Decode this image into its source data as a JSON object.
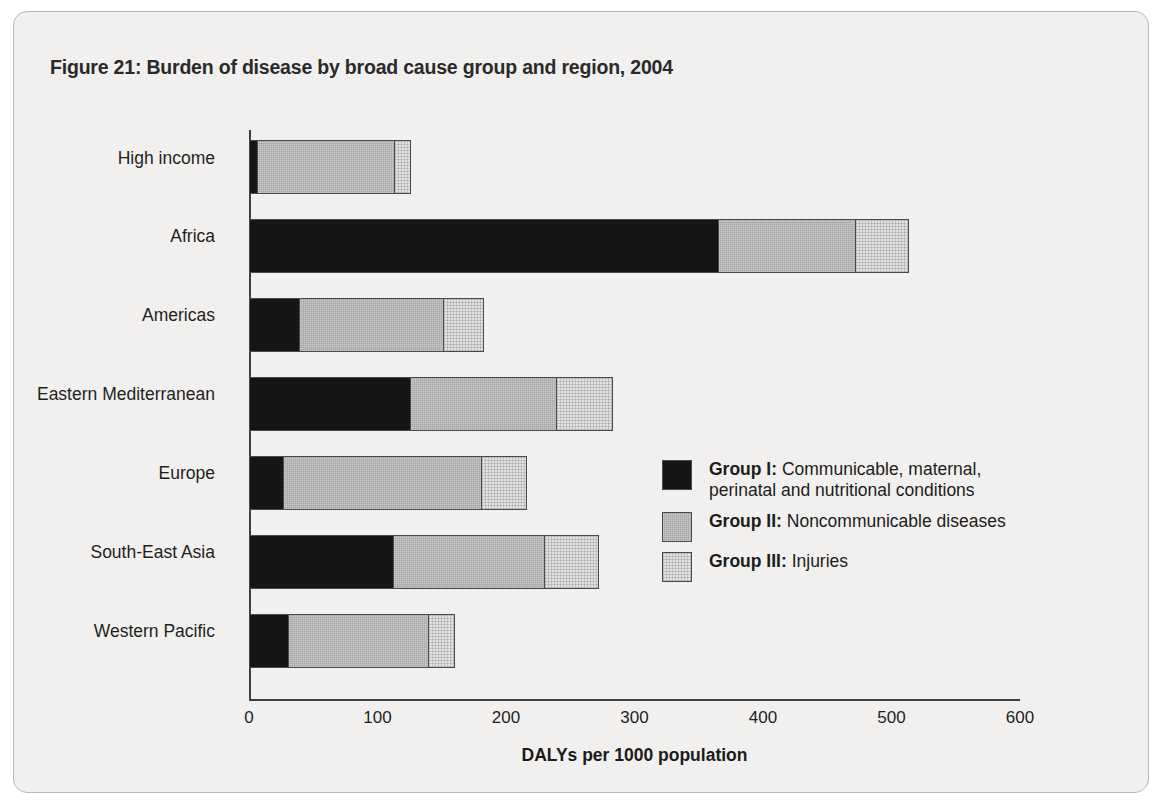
{
  "figure": {
    "title": "Figure 21: Burden of disease by broad cause group and region, 2004"
  },
  "colors": {
    "group_i": "#151515",
    "group_ii": "#a5a5a5",
    "group_iii": "#e2e2e0",
    "frame_background": "#f1f0ee",
    "frame_border": "#b9b8b6",
    "axis": "#3f3f3f"
  },
  "legend": {
    "position": "inside-right",
    "items": [
      {
        "key": "group_i",
        "bold_label": "Group I:",
        "description": " Communicable, maternal, perinatal and nutritional conditions"
      },
      {
        "key": "group_ii",
        "bold_label": "Group II:",
        "description": " Noncommunicable diseases"
      },
      {
        "key": "group_iii",
        "bold_label": "Group III:",
        "description": " Injuries"
      }
    ]
  },
  "chart_data": {
    "type": "bar",
    "orientation": "horizontal",
    "stacked": true,
    "title": "Figure 21: Burden of disease by broad cause group and region, 2004",
    "xlabel": "DALYs per 1000 population",
    "ylabel": "",
    "xlim": [
      0,
      600
    ],
    "xticks": [
      0,
      100,
      200,
      300,
      400,
      500,
      600
    ],
    "xtick_labels": [
      "0",
      "100",
      "200",
      "300",
      "400",
      "500",
      "600"
    ],
    "grid": false,
    "categories": [
      "High income",
      "Africa",
      "Americas",
      "Eastern Mediterranean",
      "Europe",
      "South-East Asia",
      "Western Pacific"
    ],
    "series": [
      {
        "name": "Group I: Communicable, maternal, perinatal and nutritional conditions",
        "color": "#151515",
        "values": [
          7,
          366,
          40,
          126,
          27,
          113,
          31
        ]
      },
      {
        "name": "Group II: Noncommunicable diseases",
        "color": "#a5a5a5",
        "values": [
          107,
          106,
          112,
          114,
          154,
          117,
          109
        ]
      },
      {
        "name": "Group III: Injuries",
        "color": "#e2e2e0",
        "values": [
          12,
          42,
          31,
          43,
          35,
          42,
          20
        ]
      }
    ],
    "totals": [
      126,
      514,
      183,
      283,
      216,
      272,
      160
    ]
  }
}
